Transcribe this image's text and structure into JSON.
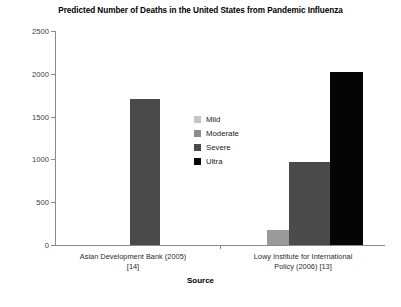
{
  "chart_data": {
    "type": "bar",
    "title": "Predicted Number of Deaths in the United States from Pandemic Influenza",
    "xlabel": "Source",
    "ylabel": "",
    "ylim": [
      0,
      2500
    ],
    "yticks": [
      0,
      500,
      1000,
      1500,
      2000,
      2500
    ],
    "ytick_labels": [
      "0",
      "500",
      "1000",
      "1500",
      "2000",
      "2500"
    ],
    "grid": false,
    "legend_position": "center",
    "categories": [
      "Asian Development Bank (2005) [14]",
      "Lowy Institute for International Policy (2006) [13]"
    ],
    "category_lines": [
      [
        "Asian Development Bank (2005)",
        "[14]"
      ],
      [
        "Lowy Institute for International",
        "Policy (2006) [13]"
      ]
    ],
    "series": [
      {
        "name": "Mild",
        "color": "#b4b4b4",
        "values": [
          null,
          null
        ]
      },
      {
        "name": "Moderate",
        "color": "#9a9a9a",
        "values": [
          null,
          175
        ]
      },
      {
        "name": "Severe",
        "color": "#4a4a4a",
        "values": [
          1700,
          975
        ]
      },
      {
        "name": "Ultra",
        "color": "#050505",
        "values": [
          null,
          2020
        ]
      }
    ]
  },
  "legend": {
    "items": [
      {
        "label": "Mild",
        "color": "#c4c4c4"
      },
      {
        "label": "Moderate",
        "color": "#8d8d8d"
      },
      {
        "label": "Severe",
        "color": "#4a4a4a"
      },
      {
        "label": "Ultra",
        "color": "#050505"
      }
    ]
  }
}
